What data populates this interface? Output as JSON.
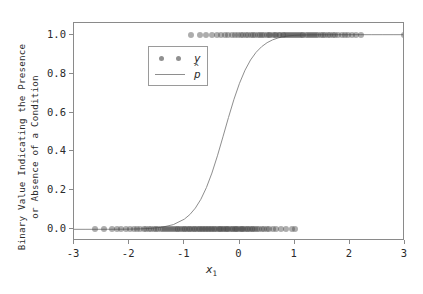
{
  "chart_data": {
    "type": "scatter",
    "title": "",
    "xlabel": "x_1",
    "xlabel_base": "x",
    "xlabel_sub": "1",
    "ylabel_line1": "Binary Value Indicating the Presence",
    "ylabel_line2": "or Absence of a Condition",
    "xlim": [
      -3,
      3
    ],
    "ylim": [
      -0.06,
      1.06
    ],
    "xticks": [
      -3,
      -2,
      -1,
      0,
      1,
      2,
      3
    ],
    "xticklabels": [
      "-3",
      "-2",
      "-1",
      "0",
      "1",
      "2",
      "3"
    ],
    "yticks": [
      0.0,
      0.2,
      0.4,
      0.6,
      0.8,
      1.0
    ],
    "yticklabels": [
      "0.0",
      "0.2",
      "0.4",
      "0.6",
      "0.8",
      "1.0"
    ],
    "grid": false,
    "legend_position": "upper left",
    "marker_color": "#4a4a4a",
    "marker_opacity": 0.45,
    "line_color": "#8e8e8e",
    "axes_color": "#8a8a8a",
    "series": [
      {
        "name": "y",
        "type": "scatter",
        "kind": "binary_observations",
        "x": [
          -2.62,
          -2.45,
          -2.31,
          -2.22,
          -2.14,
          -2.05,
          -1.98,
          -1.92,
          -1.86,
          -1.8,
          -1.74,
          -1.69,
          -1.64,
          -1.6,
          -1.55,
          -1.51,
          -1.47,
          -1.43,
          -1.39,
          -1.35,
          -1.31,
          -1.28,
          -1.24,
          -1.21,
          -1.17,
          -1.14,
          -1.11,
          -1.07,
          -1.04,
          -1.01,
          -0.98,
          -0.95,
          -0.92,
          -0.89,
          -0.86,
          -0.83,
          -0.8,
          -0.77,
          -0.74,
          -0.71,
          -0.68,
          -0.66,
          -0.63,
          -0.6,
          -0.57,
          -0.55,
          -0.52,
          -0.49,
          -0.46,
          -0.44,
          -0.41,
          -0.38,
          -0.36,
          -0.33,
          -0.3,
          -0.28,
          -0.25,
          -0.22,
          -0.2,
          -0.17,
          -0.14,
          -0.12,
          -0.09,
          -0.06,
          -0.04,
          -0.01,
          0.02,
          0.04,
          0.07,
          0.1,
          0.13,
          0.16,
          0.19,
          0.22,
          0.25,
          0.29,
          0.32,
          0.36,
          0.4,
          0.44,
          0.49,
          0.54,
          0.6,
          0.67,
          0.75,
          0.84,
          0.95,
          1.0,
          -0.88,
          -0.72,
          -0.6,
          -0.5,
          -0.41,
          -0.33,
          -0.26,
          -0.2,
          -0.14,
          -0.08,
          -0.03,
          0.02,
          0.07,
          0.12,
          0.16,
          0.21,
          0.25,
          0.29,
          0.33,
          0.37,
          0.41,
          0.45,
          0.49,
          0.53,
          0.56,
          0.6,
          0.64,
          0.67,
          0.71,
          0.74,
          0.78,
          0.81,
          0.85,
          0.88,
          0.92,
          0.95,
          0.99,
          1.02,
          1.06,
          1.09,
          1.13,
          1.16,
          1.2,
          1.24,
          1.27,
          1.31,
          1.35,
          1.39,
          1.43,
          1.47,
          1.51,
          1.55,
          1.6,
          1.64,
          1.69,
          1.74,
          1.79,
          1.85,
          1.91,
          1.97,
          2.04,
          2.12,
          2.2,
          2.98
        ],
        "y": [
          0,
          0,
          0,
          0,
          0,
          0,
          0,
          0,
          0,
          0,
          0,
          0,
          0,
          0,
          0,
          0,
          0,
          0,
          0,
          0,
          0,
          0,
          0,
          0,
          0,
          0,
          0,
          0,
          0,
          0,
          0,
          0,
          0,
          0,
          0,
          0,
          0,
          0,
          0,
          0,
          0,
          0,
          0,
          0,
          0,
          0,
          0,
          0,
          0,
          0,
          0,
          0,
          0,
          0,
          0,
          0,
          0,
          0,
          0,
          0,
          0,
          0,
          0,
          0,
          0,
          0,
          0,
          0,
          0,
          0,
          0,
          0,
          0,
          0,
          0,
          0,
          0,
          0,
          0,
          0,
          0,
          0,
          0,
          0,
          0,
          0,
          0,
          0,
          1,
          1,
          1,
          1,
          1,
          1,
          1,
          1,
          1,
          1,
          1,
          1,
          1,
          1,
          1,
          1,
          1,
          1,
          1,
          1,
          1,
          1,
          1,
          1,
          1,
          1,
          1,
          1,
          1,
          1,
          1,
          1,
          1,
          1,
          1,
          1,
          1,
          1,
          1,
          1,
          1,
          1,
          1,
          1,
          1,
          1,
          1,
          1,
          1,
          1,
          1,
          1,
          1,
          1,
          1,
          1,
          1,
          1,
          1,
          1,
          1,
          1,
          1,
          1
        ]
      },
      {
        "name": "p_hat",
        "label_base": "p",
        "label_accent": "^",
        "type": "line",
        "kind": "logistic_fit",
        "midpoint": 0.3,
        "slope": 4.0,
        "x": [
          -3.0,
          -2.8,
          -2.6,
          -2.4,
          -2.2,
          -2.0,
          -1.8,
          -1.6,
          -1.4,
          -1.2,
          -1.0,
          -0.9,
          -0.8,
          -0.7,
          -0.6,
          -0.5,
          -0.4,
          -0.3,
          -0.2,
          -0.1,
          0.0,
          0.1,
          0.2,
          0.3,
          0.4,
          0.5,
          0.6,
          0.7,
          0.8,
          0.9,
          1.0,
          1.1,
          1.2,
          1.3,
          1.4,
          1.6,
          1.8,
          2.0,
          2.2,
          2.4,
          2.6,
          2.8,
          3.0
        ],
        "y": [
          0.0,
          0.0,
          0.0001,
          0.0002,
          0.0005,
          0.001,
          0.0023,
          0.005,
          0.011,
          0.0241,
          0.0522,
          0.0759,
          0.1091,
          0.1545,
          0.2142,
          0.2891,
          0.3775,
          0.475,
          0.5744,
          0.6682,
          0.7503,
          0.8176,
          0.8699,
          0.9093,
          0.9381,
          0.9589,
          0.9734,
          0.9834,
          0.99,
          0.9941,
          0.9966,
          0.998,
          0.9988,
          0.9993,
          0.9996,
          0.9999,
          1.0,
          1.0,
          1.0,
          1.0,
          1.0,
          1.0,
          1.0
        ]
      }
    ],
    "legend": [
      {
        "label": "y",
        "handle": "markers"
      },
      {
        "label": "p",
        "handle": "line",
        "accent": "hat"
      }
    ]
  }
}
